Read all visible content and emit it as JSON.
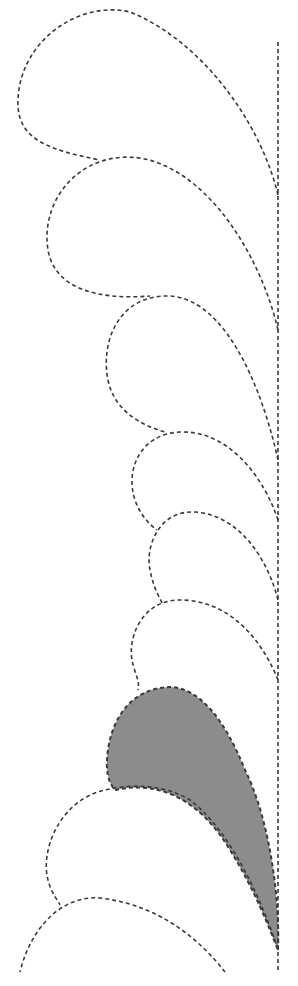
{
  "diagram": {
    "colors": {
      "background": "#ffffff",
      "stroke": "#3a3a3a",
      "highlight_fill": "#8c8c8c"
    },
    "spine": {
      "x": 278,
      "y1": 42,
      "y2": 972
    },
    "feathers": [
      {
        "id": "feather-1",
        "filled": false,
        "d": "M 278 195 C 260 120, 200 40, 130 12 C 80 0, 20 40, 18 100 C 16 140, 50 150, 100 160"
      },
      {
        "id": "feather-2",
        "filled": false,
        "d": "M 278 330 C 262 260, 210 170, 140 158 C 80 150, 40 200, 48 250 C 55 290, 100 300, 150 296"
      },
      {
        "id": "feather-3",
        "filled": false,
        "d": "M 278 460 C 265 400, 230 300, 170 296 C 120 294, 100 340, 108 380 C 114 410, 140 425, 165 432"
      },
      {
        "id": "feather-4",
        "filled": false,
        "d": "M 278 520 C 265 480, 230 430, 180 432 C 140 434, 125 470, 135 500 C 140 515, 150 525, 157 530"
      },
      {
        "id": "feather-5",
        "filled": false,
        "d": "M 278 600 C 268 560, 240 515, 195 512 C 160 510, 145 545, 150 570 C 154 590, 160 598, 162 603"
      },
      {
        "id": "feather-6",
        "filled": false,
        "d": "M 278 680 C 262 640, 230 600, 180 600 C 140 600, 128 640, 132 660 C 135 675, 140 680, 138 690"
      },
      {
        "id": "feather-7-highlighted",
        "filled": true,
        "d": "M 278 950 C 280 900, 270 820, 245 770 C 225 720, 200 688, 170 687 C 130 688, 112 720, 108 750 C 105 770, 108 782, 115 790 C 160 780, 200 800, 230 850 C 255 890, 270 930, 278 950 Z"
      },
      {
        "id": "feather-8",
        "filled": false,
        "d": "M 278 950 C 262 900, 230 830, 190 800 C 160 782, 125 785, 105 790 C 60 800, 40 850, 48 880 C 52 895, 58 900, 60 905"
      },
      {
        "id": "feather-9",
        "filled": false,
        "d": "M 225 972 C 200 940, 160 905, 100 898 C 60 895, 30 930, 20 972"
      }
    ]
  }
}
